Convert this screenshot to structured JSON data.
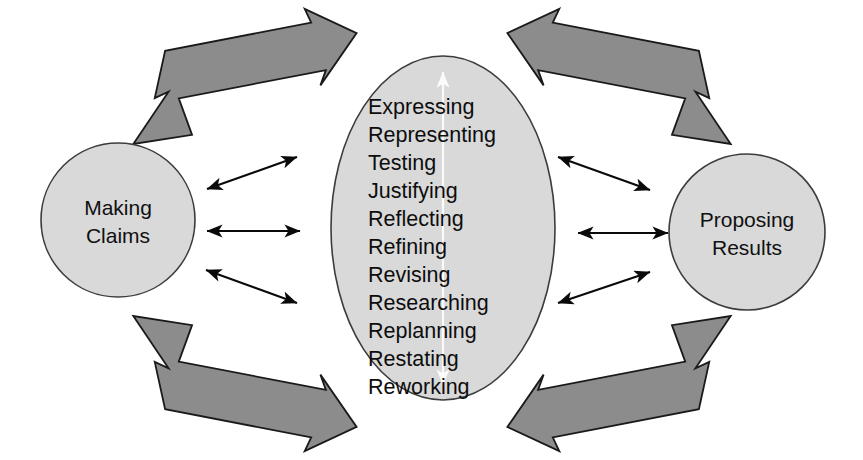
{
  "diagram": {
    "background_color": "#ffffff",
    "shape_fill_color": "#d9d9d9",
    "shape_stroke_color": "#3c3c3c",
    "thick_arrow_color": "#8c8c8c",
    "thin_arrow_color": "#0a0a0a",
    "inner_arrow_color": "#fbfbfb",
    "nodes": {
      "left_circle": {
        "name": "making-claims",
        "line1": "Making",
        "line2": "Claims"
      },
      "right_circle": {
        "name": "proposing-results",
        "line1": "Proposing",
        "line2": "Results"
      },
      "center_ellipse": {
        "name": "process-activities",
        "items": [
          "Expressing",
          "Representing",
          "Testing",
          "Justifying",
          "Reflecting",
          "Refining",
          "Revising",
          "Researching",
          "Replanning",
          "Restating",
          "Reworking"
        ]
      }
    },
    "connectors": {
      "thick": [
        {
          "name": "thick-arrow-top-left",
          "from": "making-claims",
          "to": "process-activities",
          "style": "double-headed"
        },
        {
          "name": "thick-arrow-bottom-left",
          "from": "making-claims",
          "to": "process-activities",
          "style": "double-headed"
        },
        {
          "name": "thick-arrow-top-right",
          "from": "process-activities",
          "to": "proposing-results",
          "style": "double-headed"
        },
        {
          "name": "thick-arrow-bottom-right",
          "from": "process-activities",
          "to": "proposing-results",
          "style": "double-headed"
        }
      ],
      "thin": [
        {
          "name": "thin-arrow-left-upper",
          "style": "double-headed"
        },
        {
          "name": "thin-arrow-left-middle",
          "style": "double-headed"
        },
        {
          "name": "thin-arrow-left-lower",
          "style": "double-headed"
        },
        {
          "name": "thin-arrow-right-upper",
          "style": "double-headed"
        },
        {
          "name": "thin-arrow-right-middle",
          "style": "double-headed"
        },
        {
          "name": "thin-arrow-right-lower",
          "style": "double-headed"
        }
      ],
      "inner": [
        {
          "name": "vertical-white-arrow",
          "style": "double-headed",
          "orientation": "vertical"
        }
      ]
    }
  }
}
